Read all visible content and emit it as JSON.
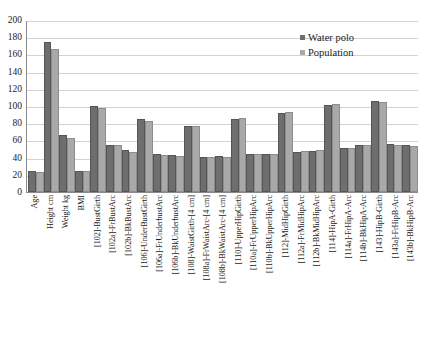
{
  "chart_data": {
    "type": "bar",
    "title": "",
    "subtitle": "",
    "xlabel": "",
    "ylabel": "",
    "ylim": [
      0,
      200
    ],
    "ytick_step": 20,
    "yticks": [
      "200",
      "180",
      "160",
      "140",
      "120",
      "100",
      "80",
      "60",
      "40",
      "20",
      "0"
    ],
    "grid": true,
    "legend_position": "top-right",
    "categories": [
      "Age",
      "Height cm",
      "Weight kg",
      "BMI",
      "[102]-BustGirth",
      "[102a]-FrBustArc",
      "[102b]-BkBustArc",
      "[106]-UnderBustGirth",
      "[106a]-FrUnderbustArc",
      "[106b]-BkUnderbustArc",
      "[108]-WaistGirth-[4 cm]",
      "[108a]-FrWaistArc-[4 cm]",
      "[108b]-BkWaistArc-[4 cm]",
      "[110]-UpperHipGirth",
      "[110a]-FrUpperHipArc",
      "[110b]-BkUpperHipArc",
      "[112]-MidHipGirth",
      "[112a]-FrMidHipArc",
      "[112b]-BkMidHipArc",
      "[114]-HipA-Girth",
      "[114a]-FrHipA-Arc",
      "[114b]-BkHipA-Arc",
      "[143]-HipB-Girth",
      "[143a]-FrHipB-Arc",
      "[143b]-BkHipB-Arc"
    ],
    "series": [
      {
        "name": "Water polo",
        "color": "#6e6e6e",
        "values": [
          22,
          172,
          64,
          22,
          98,
          52,
          47,
          82,
          42,
          41,
          75,
          38,
          39,
          83,
          42,
          42,
          89,
          44,
          45,
          99,
          49,
          52,
          103,
          53,
          52
        ]
      },
      {
        "name": "Population",
        "color": "#a9a9a9",
        "values": [
          21,
          164,
          60,
          22,
          95,
          52,
          44,
          80,
          41,
          40,
          75,
          38,
          38,
          84,
          42,
          42,
          91,
          45,
          46,
          100,
          49,
          52,
          102,
          52,
          51
        ]
      }
    ]
  },
  "legend": {
    "items": [
      {
        "label": "Water polo",
        "swatch": "series-1-swatch"
      },
      {
        "label": "Population",
        "swatch": "series-2-swatch"
      }
    ]
  }
}
